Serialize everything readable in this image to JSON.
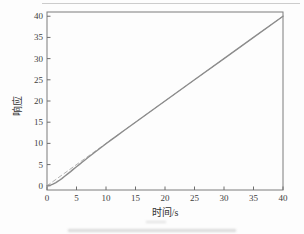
{
  "figure": {
    "background": "#fdfdfd",
    "axis_color": "#7d7d7d",
    "tick_color": "#6e6e6e",
    "tick_label_color": "#3d3d3d",
    "axis_label_color": "#333333"
  },
  "chart_data": {
    "type": "line",
    "title": "",
    "xlabel": "时间/s",
    "ylabel": "响应",
    "xlim": [
      0,
      40
    ],
    "ylim": [
      -1,
      41
    ],
    "xticks": [
      0,
      5,
      10,
      15,
      20,
      25,
      30,
      35,
      40
    ],
    "yticks": [
      0,
      5,
      10,
      15,
      20,
      25,
      30,
      35,
      40
    ],
    "grid": false,
    "legend": false,
    "series": [
      {
        "name": "reference-ramp",
        "style": "dashed",
        "color": "#b4b4b4",
        "width": 1,
        "dash": "4 3",
        "points": [
          [
            0,
            0
          ],
          [
            40,
            40
          ]
        ]
      },
      {
        "name": "ramp-response",
        "style": "solid",
        "color": "#8c8c8c",
        "width": 1.4,
        "dash": "",
        "points": [
          [
            0,
            0
          ],
          [
            0.5,
            0.1
          ],
          [
            1,
            0.37
          ],
          [
            1.5,
            0.74
          ],
          [
            2,
            1.19
          ],
          [
            2.5,
            1.7
          ],
          [
            3,
            2.23
          ],
          [
            3.5,
            2.79
          ],
          [
            4,
            3.35
          ],
          [
            4.5,
            3.92
          ],
          [
            5,
            4.49
          ],
          [
            5.5,
            5.05
          ],
          [
            6,
            5.61
          ],
          [
            6.5,
            6.16
          ],
          [
            7,
            6.71
          ],
          [
            7.5,
            7.25
          ],
          [
            8,
            7.79
          ],
          [
            9,
            8.85
          ],
          [
            10,
            9.89
          ],
          [
            11,
            10.93
          ],
          [
            12,
            11.95
          ],
          [
            13,
            12.97
          ],
          [
            14,
            13.98
          ],
          [
            15,
            14.98
          ],
          [
            16,
            15.99
          ],
          [
            18,
            17.99
          ],
          [
            20,
            20
          ],
          [
            25,
            25
          ],
          [
            30,
            30
          ],
          [
            35,
            35
          ],
          [
            40,
            40
          ]
        ]
      }
    ]
  }
}
